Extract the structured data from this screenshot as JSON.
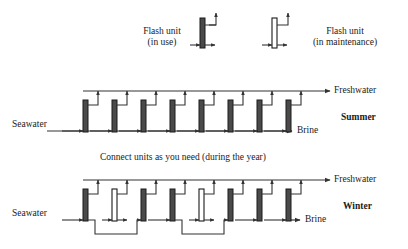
{
  "figure": {
    "type": "process-flow-diagram"
  },
  "colors": {
    "line": "#333333",
    "unit_in_use_fill": "#4a4a4a",
    "unit_in_use_stroke": "#1a1a1a",
    "unit_maintenance_fill": "#ffffff",
    "unit_maintenance_stroke": "#1a1a1a",
    "text": "#1a1a1a",
    "background": "#ffffff"
  },
  "legend": {
    "items": [
      {
        "key": "in-use",
        "line1": "Flash unit",
        "line2": "(in use)",
        "state": "in use",
        "fill": "filled"
      },
      {
        "key": "in-maintenance",
        "line1": "Flash unit",
        "line2": "(in maintenance)",
        "state": "in maintenance",
        "fill": "hollow"
      }
    ]
  },
  "caption": {
    "middle": "Connect units as you need (during the year)"
  },
  "rows": [
    {
      "key": "summer",
      "season_label": "Summer",
      "inlet_label": "Seawater",
      "outlet_bottom_label": "Brine",
      "outlet_top_label": "Freshwater",
      "unit_count": 8,
      "units": [
        {
          "index": 1,
          "state": "in use"
        },
        {
          "index": 2,
          "state": "in use"
        },
        {
          "index": 3,
          "state": "in use"
        },
        {
          "index": 4,
          "state": "in use"
        },
        {
          "index": 5,
          "state": "in use"
        },
        {
          "index": 6,
          "state": "in use"
        },
        {
          "index": 7,
          "state": "in use"
        },
        {
          "index": 8,
          "state": "in use"
        }
      ],
      "bypasses": []
    },
    {
      "key": "winter",
      "season_label": "Winter",
      "inlet_label": "Seawater",
      "outlet_bottom_label": "Brine",
      "outlet_top_label": "Freshwater",
      "unit_count": 8,
      "units": [
        {
          "index": 1,
          "state": "in use"
        },
        {
          "index": 2,
          "state": "in maintenance"
        },
        {
          "index": 3,
          "state": "in use"
        },
        {
          "index": 4,
          "state": "in use"
        },
        {
          "index": 5,
          "state": "in maintenance"
        },
        {
          "index": 6,
          "state": "in use"
        },
        {
          "index": 7,
          "state": "in use"
        },
        {
          "index": 8,
          "state": "in use"
        }
      ],
      "bypasses": [
        {
          "around_unit_index": 2,
          "from_unit_index": 1,
          "to_unit_index": 3
        },
        {
          "around_unit_index": 5,
          "from_unit_index": 4,
          "to_unit_index": 6
        }
      ]
    }
  ]
}
